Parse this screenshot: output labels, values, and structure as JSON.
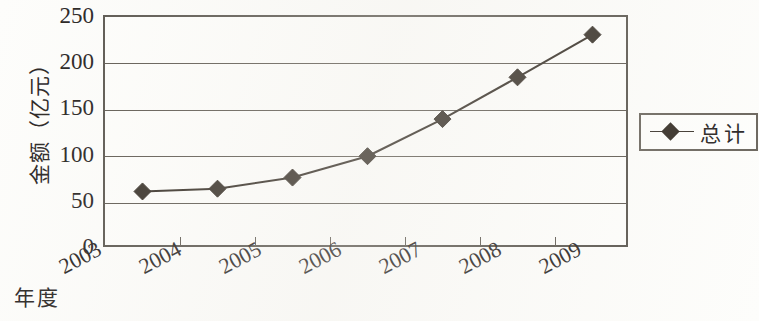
{
  "chart_data": {
    "type": "line",
    "title": "",
    "xlabel": "年度",
    "ylabel": "金额（亿元）",
    "categories": [
      "2003",
      "2004",
      "2005",
      "2006",
      "2007",
      "2008",
      "2009"
    ],
    "series": [
      {
        "name": "总计",
        "values": [
          62,
          65,
          77,
          100,
          140,
          185,
          231
        ],
        "marker": "diamond",
        "color": "#332c24"
      }
    ],
    "ylim": [
      0,
      250
    ],
    "yticks": [
      0,
      50,
      100,
      150,
      200,
      250
    ],
    "ytick_labels": [
      "0",
      "50",
      "100",
      "150",
      "200",
      "250"
    ],
    "grid": "horizontal",
    "legend_position": "right"
  },
  "legend": {
    "entries": [
      {
        "label": "总计",
        "marker_icon": "diamond-marker-icon"
      }
    ]
  },
  "axes": {
    "y_title": "金额（亿元）",
    "x_title": "年度"
  }
}
